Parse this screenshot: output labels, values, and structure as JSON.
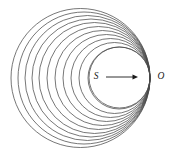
{
  "figure": {
    "background_color": "#ffffff",
    "stroke_color": "#4a4a4a",
    "arrow_color": "#1a1a1a",
    "width": 182,
    "height": 156
  },
  "labels": {
    "source_point": "S",
    "observer_point": "O"
  },
  "chart_data": {
    "type": "scatter",
    "xlabel": "",
    "ylabel": "",
    "grid": false,
    "legend": "none",
    "xlim": [
      0,
      182
    ],
    "ylim": [
      0,
      156
    ],
    "tangency_point": {
      "x": 150,
      "y": 78
    },
    "annotations": [
      {
        "text": "S",
        "x": 96,
        "y": 76
      },
      {
        "text": "O",
        "x": 161,
        "y": 76
      }
    ],
    "arrow": {
      "x1": 106,
      "y1": 77,
      "x2": 138,
      "y2": 77
    },
    "circles": [
      {
        "cx": 80.5,
        "cy": 78.0,
        "r": 69.5
      },
      {
        "cx": 84.0,
        "cy": 78.0,
        "r": 66.0
      },
      {
        "cx": 87.5,
        "cy": 78.0,
        "r": 62.5
      },
      {
        "cx": 91.0,
        "cy": 78.0,
        "r": 59.0
      },
      {
        "cx": 94.5,
        "cy": 78.0,
        "r": 55.5
      },
      {
        "cx": 98.5,
        "cy": 78.0,
        "r": 51.5
      },
      {
        "cx": 102.5,
        "cy": 78.0,
        "r": 47.5
      },
      {
        "cx": 106.5,
        "cy": 78.0,
        "r": 43.5
      },
      {
        "cx": 110.5,
        "cy": 78.0,
        "r": 39.5
      },
      {
        "cx": 114.5,
        "cy": 78.0,
        "r": 35.5
      },
      {
        "cx": 119.0,
        "cy": 78.0,
        "r": 31.0
      },
      {
        "cx": 119.5,
        "cy": 77.5,
        "r": 30.5
      }
    ]
  }
}
